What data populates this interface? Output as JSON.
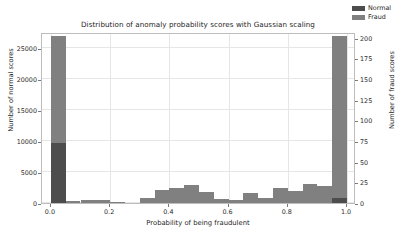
{
  "chart_data": {
    "type": "bar",
    "title": "Distribution of anomaly probability scores with Gaussian scaling",
    "xlabel": "Probability of being fraudulent",
    "ylabel": "Number of normal scores",
    "ylabel_right": "Number of fraud scores",
    "grid": true,
    "legend_position": "upper right",
    "xlim": [
      -0.03,
      1.03
    ],
    "ylim": [
      0,
      27500
    ],
    "ylim_right": [
      0,
      207
    ],
    "xticks": [
      "0.0",
      "0.2",
      "0.4",
      "0.6",
      "0.8",
      "1.0"
    ],
    "xtick_values": [
      0.0,
      0.2,
      0.4,
      0.6,
      0.8,
      1.0
    ],
    "yticks": [
      "0",
      "5000",
      "10000",
      "15000",
      "20000",
      "25000"
    ],
    "ytick_values": [
      0,
      5000,
      10000,
      15000,
      20000,
      25000
    ],
    "yticks_right": [
      "0",
      "25",
      "50",
      "75",
      "100",
      "125",
      "150",
      "175",
      "200"
    ],
    "ytick_values_right": [
      0,
      25,
      50,
      75,
      100,
      125,
      150,
      175,
      200
    ],
    "bin_edges": [
      0.0,
      0.05,
      0.1,
      0.15,
      0.2,
      0.25,
      0.3,
      0.35,
      0.4,
      0.45,
      0.5,
      0.55,
      0.6,
      0.65,
      0.7,
      0.75,
      0.8,
      0.85,
      0.9,
      0.95,
      1.0
    ],
    "bin_centers": [
      0.025,
      0.075,
      0.125,
      0.175,
      0.225,
      0.275,
      0.325,
      0.375,
      0.425,
      0.475,
      0.525,
      0.575,
      0.625,
      0.675,
      0.725,
      0.775,
      0.825,
      0.875,
      0.925,
      0.975
    ],
    "series": [
      {
        "name": "Normal",
        "axis": "left",
        "color": "#4d4d4d",
        "values": [
          9700,
          0,
          0,
          0,
          0,
          0,
          0,
          0,
          0,
          0,
          0,
          0,
          0,
          0,
          0,
          0,
          0,
          0,
          0,
          800
        ]
      },
      {
        "name": "Fraud",
        "axis": "right",
        "color": "#808080",
        "values": [
          202,
          2,
          4,
          4,
          1,
          0,
          6,
          16,
          18,
          22,
          13,
          5,
          4,
          12,
          6,
          18,
          15,
          23,
          20,
          202
        ]
      }
    ]
  },
  "legend": {
    "items": [
      {
        "label": "Normal",
        "color": "#4d4d4d"
      },
      {
        "label": "Fraud",
        "color": "#808080"
      }
    ]
  }
}
